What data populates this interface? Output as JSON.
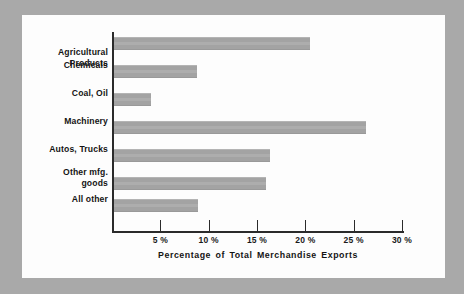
{
  "chart_data": {
    "type": "bar",
    "orientation": "horizontal",
    "title": "",
    "xlabel": "Percentage of Total Merchandise Exports",
    "ylabel": "",
    "xlim": [
      0,
      31
    ],
    "grid": false,
    "legend": null,
    "bar_color": "#a3a3a3",
    "axis_color": "#2b2b2b",
    "panel_color": "#fdfdfd",
    "page_color": "#a9a9a9",
    "categories": [
      "Agricultural\nProducts",
      "Chemicals",
      "Coal, Oil",
      "Machinery",
      "Autos, Trucks",
      "Other mfg.\ngoods",
      "All other"
    ],
    "values": [
      20.3,
      8.6,
      3.8,
      26.1,
      16.1,
      15.7,
      8.7
    ],
    "xticks": [
      5,
      10,
      15,
      20,
      25,
      30
    ],
    "xtick_labels": [
      "5 %",
      "10 %",
      "15 %",
      "20 %",
      "25 %",
      "30 %"
    ]
  }
}
